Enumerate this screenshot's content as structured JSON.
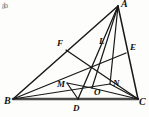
{
  "figure": {
    "stroke_color": "#181818",
    "background_color": "#fdfdfc",
    "base_color": "#4a4a4a"
  },
  "corner_artifact": {
    "text": "ab"
  },
  "labels": {
    "A": "A",
    "B": "B",
    "C": "C",
    "D": "D",
    "E": "E",
    "F": "F",
    "L": "L",
    "M": "M",
    "N": "N",
    "O": "O"
  },
  "chart_data": {
    "type": "diagram",
    "points": [
      {
        "name": "A",
        "x": 118,
        "y": 6,
        "label_x": 121,
        "label_y": 7,
        "role": "vertex"
      },
      {
        "name": "B",
        "x": 13,
        "y": 99,
        "label_x": 4,
        "label_y": 104,
        "role": "vertex"
      },
      {
        "name": "C",
        "x": 138,
        "y": 99,
        "label_x": 139,
        "label_y": 105,
        "role": "vertex"
      },
      {
        "name": "D",
        "x": 78,
        "y": 99,
        "label_x": 73,
        "label_y": 111,
        "role": "side-point"
      },
      {
        "name": "E",
        "x": 126,
        "y": 53,
        "label_x": 130,
        "label_y": 50,
        "role": "side-point"
      },
      {
        "name": "F",
        "x": 66,
        "y": 50,
        "label_x": 57,
        "label_y": 46,
        "role": "side-point"
      },
      {
        "name": "L",
        "x": 102,
        "y": 50,
        "label_x": 99,
        "label_y": 44,
        "role": "interior"
      },
      {
        "name": "M",
        "x": 67,
        "y": 83,
        "label_x": 57,
        "label_y": 87,
        "role": "interior"
      },
      {
        "name": "N",
        "x": 110,
        "y": 84,
        "label_x": 113,
        "label_y": 86,
        "role": "interior"
      },
      {
        "name": "O",
        "x": 92,
        "y": 88,
        "label_x": 94,
        "label_y": 95,
        "role": "interior"
      }
    ],
    "segments": [
      {
        "name": "AB",
        "from": "A",
        "to": "B",
        "weight": 1.5
      },
      {
        "name": "AC",
        "from": "A",
        "to": "C",
        "weight": 1.5
      },
      {
        "name": "BC",
        "from": "B",
        "to": "C",
        "weight": 2.6
      },
      {
        "name": "AD",
        "from": "A",
        "to": "D",
        "weight": 1.3
      },
      {
        "name": "BE",
        "from": "B",
        "to": "E",
        "weight": 1.3
      },
      {
        "name": "CF",
        "from": "C",
        "to": "F",
        "weight": 1.3
      },
      {
        "name": "BN",
        "from": "B",
        "to": "N",
        "weight": 1.2
      },
      {
        "name": "NC",
        "from": "N",
        "to": "C",
        "weight": 1.2
      },
      {
        "name": "AN",
        "from": "A",
        "to": "N",
        "weight": 1.2
      },
      {
        "name": "MD",
        "from": "M",
        "to": "D",
        "weight": 1.2
      },
      {
        "name": "MO",
        "from": "M",
        "to": "O",
        "weight": 1.2
      },
      {
        "name": "OC",
        "from": "O",
        "to": "C",
        "weight": 1.2
      },
      {
        "name": "AO",
        "from": "A",
        "to": "O",
        "weight": 1.2
      }
    ]
  }
}
